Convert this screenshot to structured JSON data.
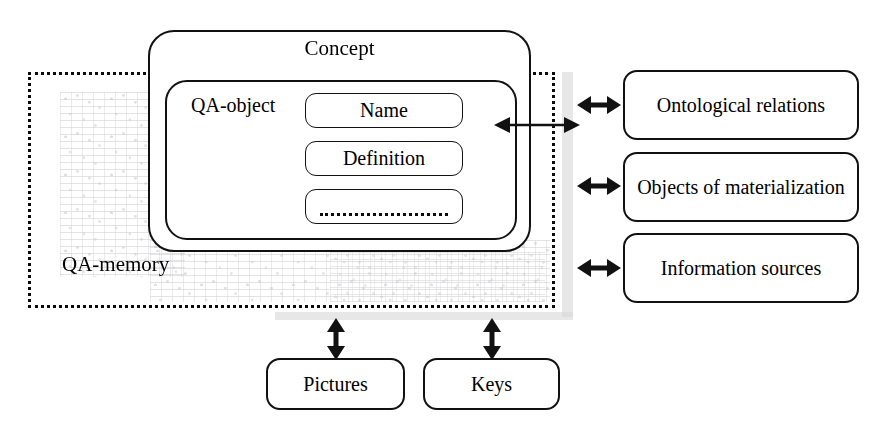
{
  "diagram": {
    "memory_region": {
      "label": "QA-memory"
    },
    "concept": {
      "label": "Concept",
      "qa_object": {
        "label": "QA-object",
        "fields": [
          {
            "label": "Name"
          },
          {
            "label": "Definition"
          },
          {
            "label": ""
          }
        ]
      }
    },
    "side_boxes": [
      {
        "label": "Ontological relations"
      },
      {
        "label": "Objects of materialization"
      },
      {
        "label": "Information sources"
      }
    ],
    "bottom_boxes": [
      {
        "label": "Pictures"
      },
      {
        "label": "Keys"
      }
    ],
    "connectors": [
      {
        "name": "concept-to-boundary",
        "kind": "double-arrow-horizontal"
      },
      {
        "name": "memory-to-ontological-relations",
        "kind": "double-arrow-horizontal"
      },
      {
        "name": "memory-to-objects-of-materialization",
        "kind": "double-arrow-horizontal"
      },
      {
        "name": "memory-to-information-sources",
        "kind": "double-arrow-horizontal"
      },
      {
        "name": "memory-to-pictures",
        "kind": "double-arrow-vertical"
      },
      {
        "name": "memory-to-keys",
        "kind": "double-arrow-vertical"
      }
    ],
    "colors": {
      "stroke": "#111111",
      "background": "#ffffff",
      "shadow_band": "#d9d9d9",
      "texture": "#5a5a64"
    }
  }
}
